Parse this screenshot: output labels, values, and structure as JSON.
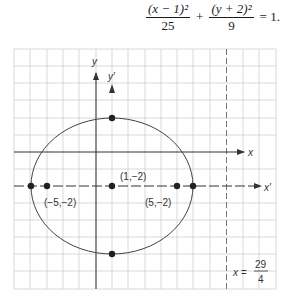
{
  "equation": {
    "term1_numerator": "(x − 1)²",
    "term1_denominator": "25",
    "plus": "+",
    "term2_numerator": "(y + 2)²",
    "term2_denominator": "9",
    "equals": "= 1."
  },
  "graph": {
    "axes": {
      "x_label": "x",
      "y_label": "y",
      "x_prime_label": "x′",
      "y_prime_label": "y′"
    },
    "points": [
      {
        "label": "(−5,−2)"
      },
      {
        "label": "(1,−2)"
      },
      {
        "label": "(5,−2)"
      }
    ],
    "directrix": {
      "lhs": "x =",
      "numerator": "29",
      "denominator": "4"
    },
    "colors": {
      "grid": "#c8c8c8",
      "ink": "#333333"
    }
  }
}
